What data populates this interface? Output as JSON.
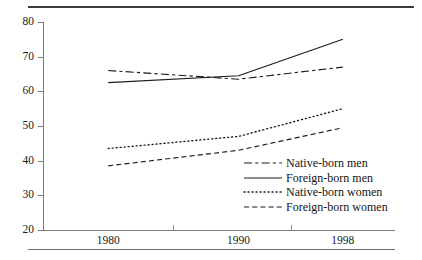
{
  "chart_data": {
    "type": "line",
    "title": "",
    "subtitle": "",
    "xlabel": "",
    "ylabel": "",
    "x": [
      1980,
      1990,
      1998
    ],
    "categories": [
      "1980",
      "1990",
      "1998"
    ],
    "xtick_labels": [
      "1980",
      "1990",
      "1998"
    ],
    "ytick_labels": [
      "20",
      "30",
      "40",
      "50",
      "60",
      "70",
      "80"
    ],
    "ytick_values": [
      20,
      30,
      40,
      50,
      60,
      70,
      80
    ],
    "ylim": [
      20,
      80
    ],
    "xlim": [
      1975,
      2002
    ],
    "grid": false,
    "legend_position": "inside-bottom-right",
    "series": [
      {
        "name": "Native-born men",
        "values": [
          66,
          63.5,
          67
        ],
        "style": "dash-dot",
        "color": "#1a1a1a"
      },
      {
        "name": "Foreign-born men",
        "values": [
          62.5,
          64.5,
          75
        ],
        "style": "solid",
        "color": "#1a1a1a"
      },
      {
        "name": "Native-born women",
        "values": [
          43.5,
          47,
          55
        ],
        "style": "dotted",
        "color": "#1a1a1a"
      },
      {
        "name": "Foreign-born women",
        "values": [
          38.5,
          43,
          49.5
        ],
        "style": "dashed",
        "color": "#1a1a1a"
      }
    ]
  },
  "legend": {
    "items": [
      {
        "label": "Native-born men",
        "style": "dash-dot"
      },
      {
        "label": "Foreign-born men",
        "style": "solid"
      },
      {
        "label": "Native-born women",
        "style": "dotted"
      },
      {
        "label": "Foreign-born women",
        "style": "dashed"
      }
    ]
  },
  "axes": {
    "y_labels": [
      "80",
      "70",
      "60",
      "50",
      "40",
      "30",
      "20"
    ],
    "x_labels": [
      "1980",
      "1990",
      "1998"
    ]
  },
  "colors": {
    "ink": "#1a1a1a",
    "axis": "#7a7a7a",
    "rule_top": "#3b3b3b",
    "rule_bottom": "#6e6e6e",
    "background": "#ffffff"
  }
}
